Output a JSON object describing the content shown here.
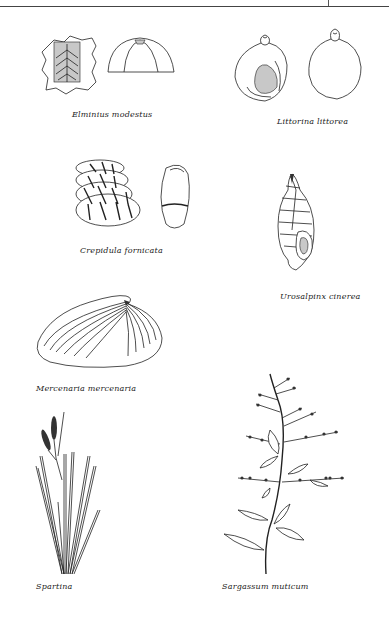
{
  "page": {
    "header_rule": true
  },
  "figures": [
    {
      "id": "elminius",
      "caption": "Elminius modestus"
    },
    {
      "id": "littorina",
      "caption": "Littorina littorea"
    },
    {
      "id": "crepidula",
      "caption": "Crepidula fornicata"
    },
    {
      "id": "urosalpinx",
      "caption": "Urosalpinx cinerea"
    },
    {
      "id": "mercenaria",
      "caption": "Mercenaria mercenaria"
    },
    {
      "id": "spartina",
      "caption": "Spartina"
    },
    {
      "id": "sargassum",
      "caption": "Sargassum muticum"
    }
  ],
  "colors": {
    "ink": "#222222",
    "shade": "#c8c8c8",
    "background": "#ffffff"
  }
}
